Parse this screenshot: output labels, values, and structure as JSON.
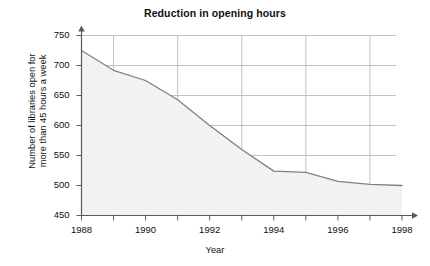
{
  "chart_data": {
    "type": "area",
    "title": "Reduction in opening hours",
    "xlabel": "Year",
    "ylabel": "Number of libraries open for more than 45 hours a week",
    "ylabel_line1": "Number of libraries open for",
    "ylabel_line2": "more than 45 hours a week",
    "x": [
      1988,
      1989,
      1990,
      1991,
      1992,
      1993,
      1994,
      1995,
      1996,
      1997,
      1998
    ],
    "values": [
      725,
      692,
      675,
      643,
      600,
      560,
      524,
      522,
      507,
      502,
      500
    ],
    "series": [
      {
        "name": "Number of libraries open for more than 45 hours a week",
        "values": [
          725,
          692,
          675,
          643,
          600,
          560,
          524,
          522,
          507,
          502,
          500
        ]
      }
    ],
    "xlim": [
      1988,
      1998
    ],
    "ylim": [
      450,
      750
    ],
    "xticks": [
      1988,
      1989,
      1990,
      1991,
      1992,
      1993,
      1994,
      1995,
      1996,
      1997,
      1998
    ],
    "xtick_labels": [
      "1988",
      "",
      "1990",
      "",
      "1992",
      "",
      "1994",
      "",
      "1996",
      "",
      "1998"
    ],
    "xtick_labels_shown": [
      "1988",
      "1990",
      "1992",
      "1994",
      "1996",
      "1998"
    ],
    "yticks": [
      450,
      500,
      550,
      600,
      650,
      700,
      750
    ],
    "ytick_labels": [
      "450",
      "500",
      "550",
      "600",
      "650",
      "700",
      "750"
    ],
    "grid": true,
    "grid_x": [
      1989,
      1991,
      1993,
      1995,
      1997
    ],
    "grid_y": [
      500,
      550,
      600,
      650,
      700,
      750
    ],
    "legend": "none",
    "colors": {
      "line": "#808080",
      "fill": "#f2f2f2",
      "grid": "#b3b3b3",
      "axis": "#595959",
      "text": "#111111",
      "background": "#ffffff"
    }
  }
}
